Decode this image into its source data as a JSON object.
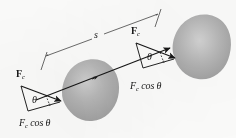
{
  "figure": {
    "background_color": "#fbfbfa",
    "ink_color": "#161616",
    "blob_fill": "#a8a8a8",
    "blob_highlight": "#c9c9c9",
    "labels": {
      "force_vector_left": {
        "symbol": "F",
        "subscript": "c"
      },
      "force_vector_right": {
        "symbol": "F",
        "subscript": "c"
      },
      "angle_left": "θ",
      "angle_right": "θ",
      "component_left": {
        "symbol": "F",
        "subscript": "c",
        "trig": "cos θ"
      },
      "component_right": {
        "symbol": "F",
        "subscript": "c",
        "trig": "cos θ"
      },
      "displacement": "s"
    },
    "geometry": {
      "displacement_line": {
        "x1": 36,
        "y1": 100,
        "x2": 172,
        "y2": 47
      },
      "dimension_line": {
        "x1": 45,
        "y1": 56,
        "x2": 159,
        "y2": 13
      },
      "blob_left_center": {
        "cx": 86,
        "cy": 85
      },
      "blob_right_center": {
        "cx": 196,
        "cy": 42
      },
      "force_left_tail": {
        "x": 22,
        "y": 85
      },
      "force_left_tip": {
        "x": 62,
        "y": 101
      },
      "force_right_tail": {
        "x": 137,
        "y": 42
      },
      "force_right_tip": {
        "x": 176,
        "y": 58
      }
    }
  }
}
